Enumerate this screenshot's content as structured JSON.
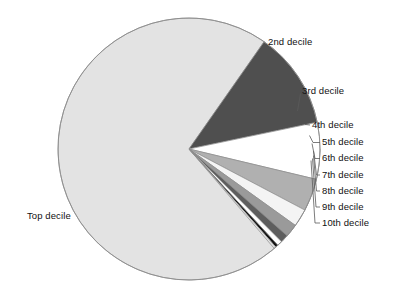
{
  "chart_data": {
    "type": "pie",
    "title": "",
    "subtitle": "",
    "xlabel": "",
    "ylabel": "",
    "legend_position": "callout-labels",
    "grid": false,
    "categories": [
      "Top decile",
      "2nd decile",
      "3rd decile",
      "4th decile",
      "5th decile",
      "6th decile",
      "7th decile",
      "8th decile",
      "9th decile",
      "10th decile"
    ],
    "values": [
      71.0,
      12.0,
      7.0,
      4.0,
      2.2,
      1.6,
      1.0,
      0.6,
      0.35,
      0.25
    ],
    "units": "percent of total",
    "slices": [
      {
        "label": "Top decile",
        "value": 71.0,
        "color": "#e3e3e3",
        "start_angle_deg": 55.0,
        "end_angle_deg": 360.0
      },
      {
        "label": "2nd decile",
        "value": 12.0,
        "color": "#4f4f4f",
        "start_angle_deg": 11.8,
        "end_angle_deg": 55.0
      },
      {
        "label": "3rd decile",
        "value": 7.0,
        "color": "#ffffff",
        "start_angle_deg": -13.4,
        "end_angle_deg": 11.8
      },
      {
        "label": "4th decile",
        "value": 4.0,
        "color": "#b0b0b0",
        "start_angle_deg": -27.8,
        "end_angle_deg": -13.4
      },
      {
        "label": "5th decile",
        "value": 2.2,
        "color": "#f4f4f4",
        "start_angle_deg": -35.7,
        "end_angle_deg": -27.8
      },
      {
        "label": "6th decile",
        "value": 1.6,
        "color": "#9a9a9a",
        "start_angle_deg": -41.5,
        "end_angle_deg": -35.7
      },
      {
        "label": "7th decile",
        "value": 1.0,
        "color": "#5e5e5e",
        "start_angle_deg": -45.1,
        "end_angle_deg": -41.5
      },
      {
        "label": "8th decile",
        "value": 0.6,
        "color": "#ffffff",
        "start_angle_deg": -47.3,
        "end_angle_deg": -45.1
      },
      {
        "label": "9th decile",
        "value": 0.35,
        "color": "#111111",
        "start_angle_deg": -48.5,
        "end_angle_deg": -47.3
      },
      {
        "label": "10th decile",
        "value": 0.25,
        "color": "#e3e3e3",
        "start_angle_deg": -49.4,
        "end_angle_deg": -48.5
      }
    ],
    "geometry": {
      "center_x": 189,
      "center_y": 149,
      "radius": 131
    },
    "colors": {
      "top_decile": "#e3e3e3",
      "second_decile": "#4f4f4f",
      "third_decile": "#ffffff",
      "fourth_decile": "#b0b0b0",
      "outline": "#8c8c8c",
      "leader_line": "#5a5a5a",
      "text": "#111111",
      "background": "#ffffff"
    }
  },
  "labels": {
    "top_decile": "Top decile",
    "second_decile": "2nd decile",
    "third_decile": "3rd decile",
    "fourth_decile": "4th decile",
    "fifth_decile": "5th decile",
    "sixth_decile": "6th decile",
    "seventh_decile": "7th decile",
    "eighth_decile": "8th decile",
    "ninth_decile": "9th decile",
    "tenth_decile": "10th decile"
  }
}
